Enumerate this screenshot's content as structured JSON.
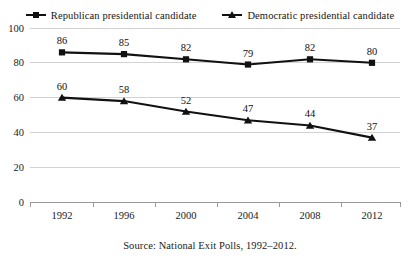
{
  "chart_data": {
    "type": "line",
    "title": "",
    "subtitle": "",
    "xlabel": "",
    "ylabel": "",
    "categories": [
      "1992",
      "1996",
      "2000",
      "2004",
      "2008",
      "2012"
    ],
    "series": [
      {
        "name": "Republican presidential candidate",
        "marker": "square",
        "color": "#111111",
        "values": [
          86,
          85,
          82,
          79,
          82,
          80
        ],
        "labels": [
          "86",
          "85",
          "82",
          "79",
          "82",
          "80"
        ]
      },
      {
        "name": "Democratic presidential candidate",
        "marker": "triangle",
        "color": "#111111",
        "values": [
          60,
          58,
          52,
          47,
          44,
          37
        ],
        "labels": [
          "60",
          "58",
          "52",
          "47",
          "44",
          "37"
        ]
      }
    ],
    "ylim": [
      0,
      100
    ],
    "yticks": [
      0,
      20,
      40,
      60,
      80,
      100
    ],
    "ytick_labels": [
      "0",
      "20",
      "40",
      "60",
      "80",
      "100"
    ],
    "grid": true,
    "grid_color": "#d2d2d2",
    "legend_position": "top-center",
    "data_labels": true
  },
  "legend": {
    "entries": [
      {
        "label": "Republican presidential candidate"
      },
      {
        "label": "Democratic presidential candidate"
      }
    ]
  },
  "caption": {
    "text": "Source: National Exit Polls, 1992–2012."
  }
}
